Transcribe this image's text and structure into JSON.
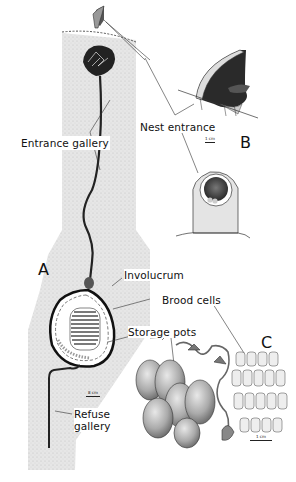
{
  "figure": {
    "panels": {
      "a": "A",
      "b": "B",
      "c": "C"
    },
    "labels": {
      "entrance_gallery": "Entrance gallery",
      "nest_entrance": "Nest entrance",
      "involucrum": "Involucrum",
      "brood_cells": "Brood cells",
      "storage_pots": "Storage pots",
      "refuse_gallery_line1": "Refuse",
      "refuse_gallery_line2": "gallery"
    },
    "scale_bars": {
      "a": "8 cm",
      "b": "1 cm",
      "c": "1 cm"
    }
  }
}
